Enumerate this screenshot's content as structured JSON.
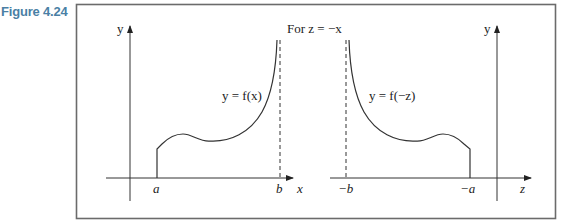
{
  "figure": {
    "label": "Figure 4.24",
    "header_text": "For z = −x",
    "left_graph": {
      "y_axis_label": "y",
      "x_axis_label": "x",
      "curve_label": "y = f(x)",
      "tick_a": "a",
      "tick_b": "b"
    },
    "right_graph": {
      "y_axis_label": "y",
      "x_axis_label": "z",
      "curve_label": "y = f(−z)",
      "tick_neg_b": "−b",
      "tick_neg_a": "−a"
    },
    "colors": {
      "label": "#4a7fa5",
      "frame": "#6b6b6b",
      "line": "#333333"
    }
  }
}
